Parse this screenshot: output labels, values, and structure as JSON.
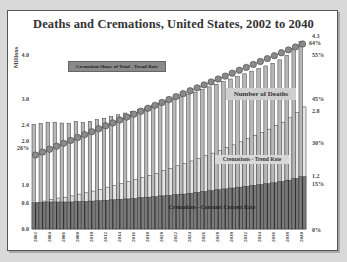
{
  "chart_data": {
    "type": "bar",
    "title": "Deaths and Cremations, United States, 2002 to 2040",
    "xlabel": "",
    "ylabel": "Millions",
    "ylim": [
      0,
      4.4
    ],
    "y_ticks": [
      "0.0",
      "0.6",
      "1.0",
      "2.0",
      "2.4",
      "3.0",
      "4.0"
    ],
    "right_axis_labels": [
      "0%",
      "15%",
      "30%",
      "45%",
      "55%",
      "64%"
    ],
    "right_value_labels": [
      "4.3",
      "2.8",
      "1.2"
    ],
    "left_extra_labels": [
      "2.4",
      "0.6",
      "26%"
    ],
    "categories": [
      "2002",
      "2003",
      "2004",
      "2005",
      "2006",
      "2007",
      "2008",
      "2009",
      "2010",
      "2011",
      "2012",
      "2013",
      "2014",
      "2015",
      "2016",
      "2017",
      "2018",
      "2019",
      "2020",
      "2021",
      "2022",
      "2023",
      "2024",
      "2025",
      "2026",
      "2027",
      "2028",
      "2029",
      "2030",
      "2031",
      "2032",
      "2033",
      "2034",
      "2035",
      "2036",
      "2037",
      "2038",
      "2039",
      "2040"
    ],
    "x_tick_labels": [
      "2002",
      "2004",
      "2006",
      "2008",
      "2010",
      "2012",
      "2014",
      "2016",
      "2018",
      "2020",
      "2022",
      "2024",
      "2026",
      "2028",
      "2030",
      "2032",
      "2034",
      "2036",
      "2038",
      "2040"
    ],
    "series": [
      {
        "name": "Number of Deaths",
        "type": "bar",
        "values": [
          2.4,
          2.42,
          2.45,
          2.45,
          2.43,
          2.42,
          2.47,
          2.44,
          2.47,
          2.51,
          2.54,
          2.58,
          2.62,
          2.66,
          2.7,
          2.74,
          2.78,
          2.83,
          2.88,
          2.93,
          2.98,
          3.03,
          3.08,
          3.14,
          3.2,
          3.26,
          3.32,
          3.38,
          3.44,
          3.5,
          3.56,
          3.62,
          3.68,
          3.74,
          3.8,
          3.88,
          3.98,
          4.12,
          4.3
        ]
      },
      {
        "name": "Cremations - Trend Rate",
        "type": "bar",
        "values": [
          0.6,
          0.64,
          0.68,
          0.71,
          0.73,
          0.76,
          0.8,
          0.83,
          0.87,
          0.91,
          0.96,
          1.0,
          1.04,
          1.09,
          1.13,
          1.18,
          1.23,
          1.28,
          1.34,
          1.39,
          1.45,
          1.5,
          1.56,
          1.62,
          1.68,
          1.74,
          1.8,
          1.87,
          1.93,
          2.0,
          2.07,
          2.14,
          2.21,
          2.29,
          2.37,
          2.45,
          2.55,
          2.67,
          2.8
        ]
      },
      {
        "name": "Cremations - Constant Current Rate",
        "type": "bar",
        "values": [
          0.6,
          0.61,
          0.62,
          0.62,
          0.62,
          0.62,
          0.63,
          0.63,
          0.64,
          0.65,
          0.66,
          0.67,
          0.68,
          0.69,
          0.7,
          0.72,
          0.73,
          0.74,
          0.76,
          0.77,
          0.79,
          0.8,
          0.82,
          0.84,
          0.86,
          0.88,
          0.9,
          0.92,
          0.94,
          0.96,
          0.98,
          1.0,
          1.02,
          1.04,
          1.06,
          1.09,
          1.12,
          1.16,
          1.2
        ]
      },
      {
        "name": "Cremation Share of Total - Trend Rate",
        "type": "line",
        "unit": "%",
        "values": [
          26,
          27,
          28,
          29,
          30,
          31,
          32,
          33,
          34,
          35,
          36,
          37,
          38,
          39,
          40,
          41,
          42,
          43,
          44,
          45,
          46,
          47,
          48,
          49,
          50,
          51,
          52,
          53,
          54,
          55,
          56,
          57,
          58,
          59,
          60,
          61,
          62,
          63,
          64
        ]
      }
    ],
    "legend_position": "inline labels",
    "grid": false
  },
  "labels": {
    "title": "Deaths and Cremations, United States, 2002 to 2040",
    "y_unit": "Millions",
    "legend_share": "Cremation Share of Total - Trend Rate",
    "legend_deaths": "Number of Deaths",
    "legend_trend": "Cremations - Trend Rate",
    "legend_const": "Cremations - Constant Current Rate",
    "y_ticks": {
      "t40": "4.0",
      "t30": "3.0",
      "t24": "2.4",
      "t20": "2.0",
      "t26p": "26%",
      "t10": "1.0",
      "t06": "0.6",
      "t00": "0.0"
    },
    "right": {
      "v43": "4.3",
      "p64": "64%",
      "p55": "55%",
      "p45": "45%",
      "v28": "2.8",
      "p30": "30%",
      "v12": "1.2",
      "p15": "15%",
      "p0": "0%"
    },
    "x": [
      "2002",
      "2004",
      "2006",
      "2008",
      "2010",
      "2012",
      "2014",
      "2016",
      "2018",
      "2020",
      "2022",
      "2024",
      "2026",
      "2028",
      "2030",
      "2032",
      "2034",
      "2036",
      "2038",
      "2040"
    ]
  },
  "colors": {
    "deaths_bar": "#b8b8b8",
    "trend_bar": "#e6e6e6",
    "const_bar": "#7a7a7a",
    "bar_outline": "#3a3a3a",
    "share_marker": "#8a8a8a",
    "frame_bg": "#ffffff",
    "page_bg": "#d9d9d9"
  }
}
